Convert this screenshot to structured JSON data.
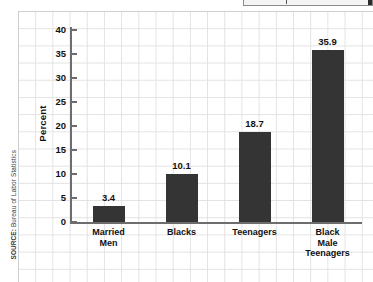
{
  "source_note": {
    "lead": "SOURCE:",
    "text": " Bureau of Labor Statistics"
  },
  "top_strip": {
    "name": "cropped-toolbar-strip"
  },
  "chart_data": {
    "type": "bar",
    "title": "",
    "xlabel": "",
    "ylabel": "Percent",
    "categories": [
      "Married Men",
      "Blacks",
      "Teenagers",
      "Black Male Teenagers"
    ],
    "category_lines": [
      [
        "Married",
        "Men"
      ],
      [
        "Blacks"
      ],
      [
        "Teenagers"
      ],
      [
        "Black",
        "Male",
        "Teenagers"
      ]
    ],
    "values": [
      3.4,
      10.1,
      18.7,
      35.9
    ],
    "value_labels": [
      "3.4",
      "10.1",
      "18.7",
      "35.9"
    ],
    "ylim": [
      0,
      40
    ],
    "ytick_values": [
      0,
      5,
      10,
      15,
      20,
      25,
      30,
      35,
      40
    ],
    "ytick_labels": [
      "0",
      "5",
      "10",
      "15",
      "20",
      "25",
      "30",
      "35",
      "40"
    ],
    "grid": true,
    "legend": "none",
    "bar_color": "#343434",
    "axis_color": "#6d6d6d",
    "grid_color": "#e2e2e2",
    "background": "#ffffff"
  }
}
